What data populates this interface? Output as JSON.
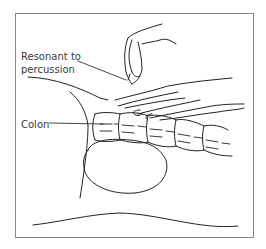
{
  "figure": {
    "type": "line illustration",
    "labels": [
      {
        "text_line1": "Resonant to",
        "text_line2": "percussion"
      },
      {
        "text": "Colon"
      }
    ]
  },
  "colors": {
    "ink": "#222222",
    "frame": "#8a8a8a",
    "label": "#3a3a3a",
    "background": "#ffffff"
  }
}
